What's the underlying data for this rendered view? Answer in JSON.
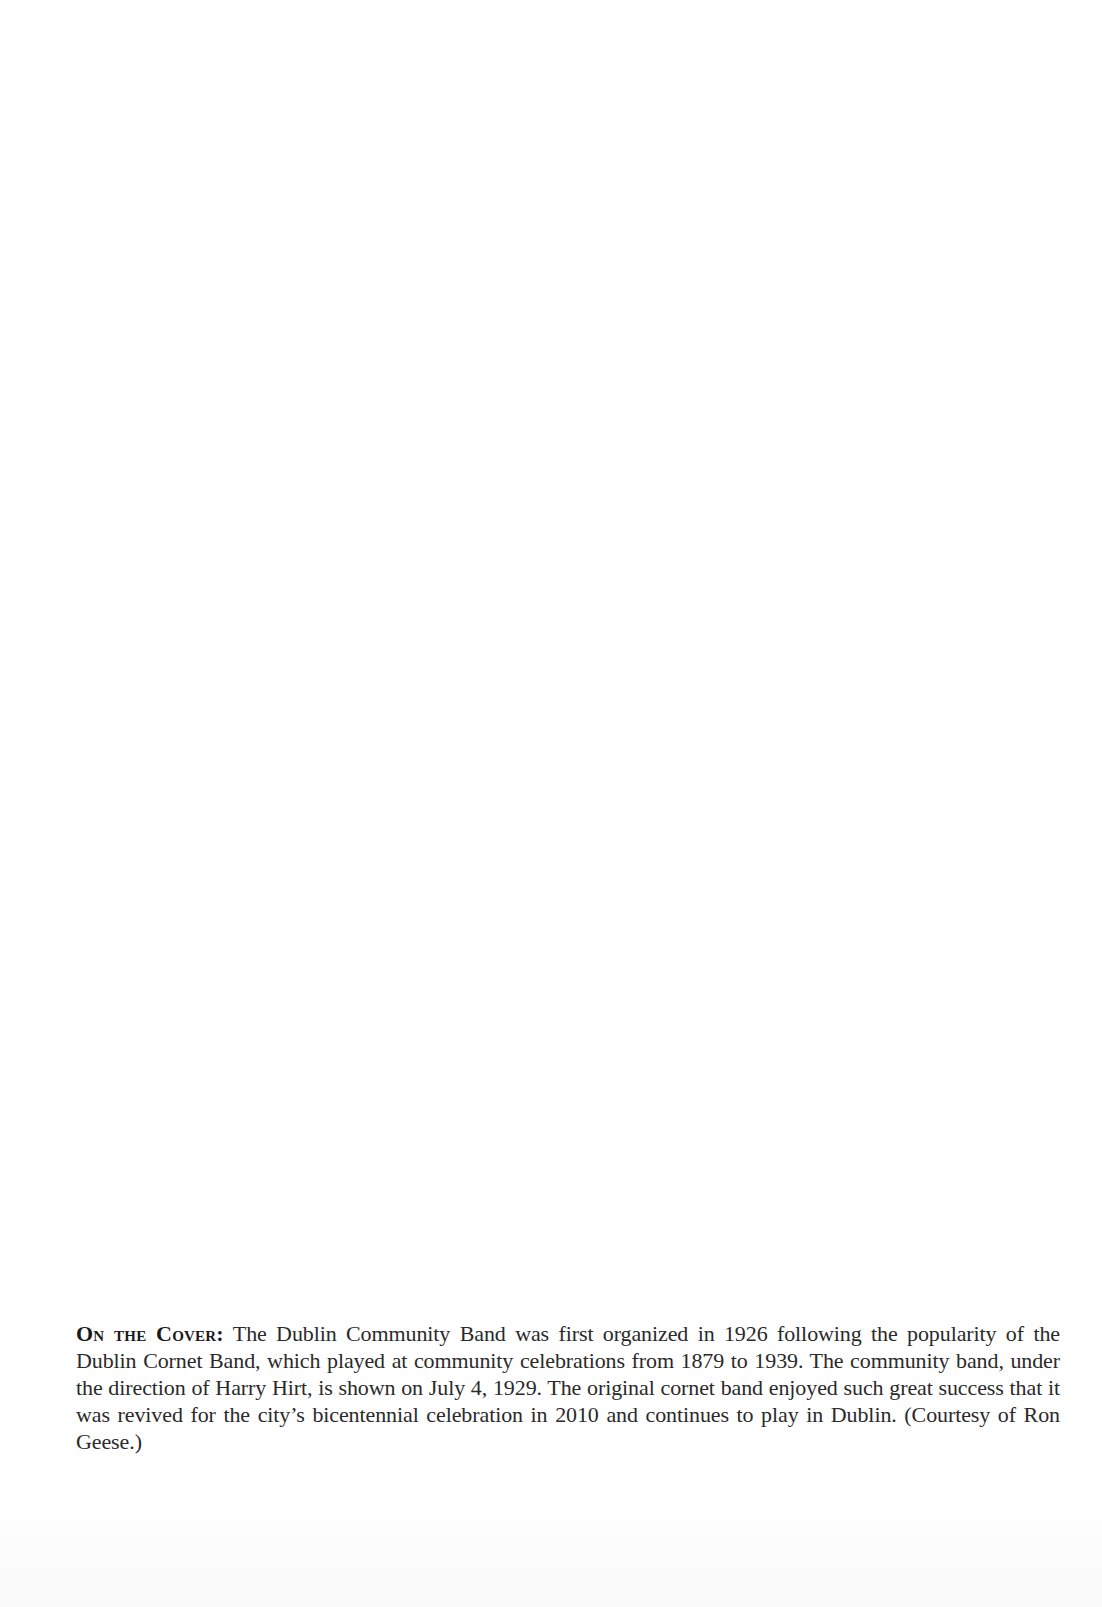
{
  "caption": {
    "label": "On the Cover:",
    "text": " The Dublin Community Band was first organized in 1926 following the popularity of the Dublin Cornet Band, which played at community celebrations from 1879 to 1939. The community band, under the direction of Harry Hirt, is shown on July 4, 1929. The original cornet band enjoyed such great success that it was revived for the city’s bicentennial celebration in 2010 and continues to play in Dublin. (Courtesy of Ron Geese.)"
  }
}
